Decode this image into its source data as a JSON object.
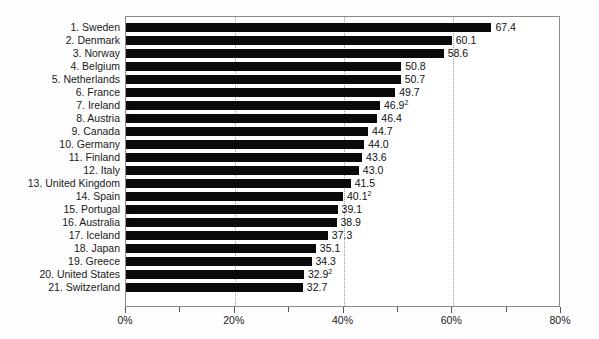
{
  "chart_data": {
    "type": "bar",
    "orientation": "horizontal",
    "title": "",
    "subtitle": "",
    "xlabel": "",
    "ylabel": "",
    "xlim": [
      0,
      80
    ],
    "grid": "vertical-dotted-at-20-40-60",
    "legend": "none",
    "value_suffix": "%",
    "categories": [
      "1. Sweden",
      "2. Denmark",
      "3. Norway",
      "4. Belgium",
      "5. Netherlands",
      "6. France",
      "7. Ireland",
      "8. Austria",
      "9. Canada",
      "10. Germany",
      "11. Finland",
      "12. Italy",
      "13. United Kingdom",
      "14. Spain",
      "15. Portugal",
      "16. Australia",
      "17. Iceland",
      "18. Japan",
      "19. Greece",
      "20. United States",
      "21. Switzerland"
    ],
    "values": [
      67.4,
      60.1,
      58.6,
      50.8,
      50.7,
      49.7,
      46.9,
      46.4,
      44.7,
      44.0,
      43.6,
      43.0,
      41.5,
      40.1,
      39.1,
      38.9,
      37.3,
      35.1,
      34.3,
      32.9,
      32.7
    ],
    "value_labels": [
      "67.4",
      "60.1",
      "58.6",
      "50.8",
      "50.7",
      "49.7",
      "46.9",
      "46.4",
      "44.7",
      "44.0",
      "43.6",
      "43.0",
      "41.5",
      "40.1",
      "39.1",
      "38.9",
      "37.3",
      "35.1",
      "34.3",
      "32.9",
      "32.7"
    ],
    "footnote_markers": [
      "",
      "",
      "",
      "",
      "",
      "",
      "2",
      "",
      "",
      "",
      "",
      "",
      "",
      "2",
      "",
      "",
      "",
      "",
      "",
      "2",
      ""
    ],
    "xticks": [
      0,
      10,
      20,
      30,
      40,
      50,
      60,
      70,
      80
    ],
    "xtick_labels": [
      "0%",
      "",
      "20%",
      "",
      "40%",
      "",
      "60%",
      "",
      "80%"
    ],
    "bar_color": "#0a0a0a",
    "grid_color": "#9a9a9a",
    "frame_color": "#8a8a8a",
    "background_color": "#ffffff"
  }
}
